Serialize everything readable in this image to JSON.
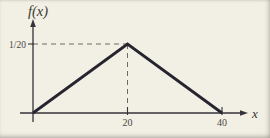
{
  "figure": {
    "background": "#f2efe5",
    "curve_color": "#26252f",
    "axis_color": "#34323a",
    "dash_color": "#6e6a5e",
    "text_color": "#4a473e"
  },
  "chart_data": {
    "type": "line",
    "title": "",
    "xlabel": "x",
    "ylabel": "f(x)",
    "x": [
      0,
      20,
      40
    ],
    "values": [
      0,
      0.05,
      0
    ],
    "xlim": [
      0,
      44
    ],
    "ylim": [
      0,
      0.065
    ],
    "x_ticks": [
      {
        "value": 20,
        "label": "20"
      },
      {
        "value": 40,
        "label": "40"
      }
    ],
    "y_ticks": [
      {
        "value": 0.05,
        "label": "1/20"
      }
    ],
    "grid": false,
    "legend": false,
    "annotations": [
      {
        "kind": "dashed-guide",
        "from_x": 0,
        "from_y": 0.05,
        "to_x": 20,
        "to_y": 0.05
      },
      {
        "kind": "dashed-guide",
        "from_x": 20,
        "from_y": 0.05,
        "to_x": 20,
        "to_y": 0
      }
    ]
  }
}
